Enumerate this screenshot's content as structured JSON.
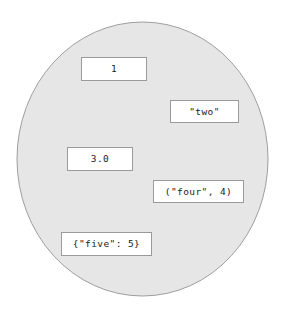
{
  "canvas": {
    "width": 286,
    "height": 313,
    "background_color": "#ffffff"
  },
  "container": {
    "shape": "ellipse",
    "fill_color": "#e6e6e6",
    "stroke_color": "#9e9e9e",
    "stroke_width": 1,
    "center_x": 142.5,
    "center_y": 159,
    "radius_x": 125.5,
    "radius_y": 137
  },
  "items": [
    {
      "label": "1",
      "name": "value-box-int",
      "x": 81,
      "y": 57,
      "width": 66,
      "height": 24
    },
    {
      "label": "\"two\"",
      "name": "value-box-string",
      "x": 170,
      "y": 100,
      "width": 69,
      "height": 23
    },
    {
      "label": "3.0",
      "name": "value-box-float",
      "x": 67,
      "y": 147,
      "width": 66,
      "height": 24
    },
    {
      "label": "(\"four\", 4)",
      "name": "value-box-tuple",
      "x": 153,
      "y": 180,
      "width": 91,
      "height": 23
    },
    {
      "label": "{\"five\": 5}",
      "name": "value-box-dict",
      "x": 61,
      "y": 232,
      "width": 91,
      "height": 24
    }
  ]
}
